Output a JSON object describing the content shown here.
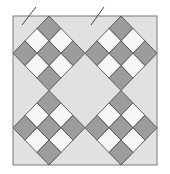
{
  "diagram": {
    "colors": {
      "page_background": "#ffffff",
      "block_background": "#e1e1e1",
      "block_border": "#7a7a7a",
      "dark_patch": "#9c9c9c",
      "light_patch": "#f6f6f6",
      "seam_line": "#505050",
      "cut_mark": "#444444"
    },
    "layout": {
      "blocks_per_row": 2,
      "blocks_per_column": 2
    },
    "nine_patch": {
      "grid_size": 3,
      "pattern": [
        [
          "dark",
          "light",
          "dark"
        ],
        [
          "light",
          "dark",
          "light"
        ],
        [
          "dark",
          "light",
          "dark"
        ]
      ]
    },
    "blocks": [
      {
        "id": "top-left",
        "row": 0,
        "col": 0
      },
      {
        "id": "top-right",
        "row": 0,
        "col": 1
      },
      {
        "id": "bottom-left",
        "row": 1,
        "col": 0
      },
      {
        "id": "bottom-right",
        "row": 1,
        "col": 1
      }
    ],
    "cut_marks": [
      {
        "id": "left-cut-mark"
      },
      {
        "id": "right-cut-mark"
      }
    ]
  }
}
